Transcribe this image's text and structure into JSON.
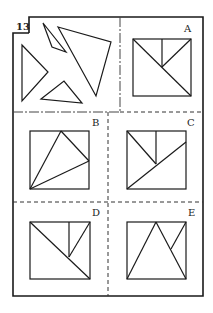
{
  "puzzle": {
    "number": "13",
    "question_panel": {
      "description": "four triangle pieces",
      "pieces": [
        {
          "points": "43,23 52,47 66,52"
        },
        {
          "points": "58,27 111,42 96,96"
        },
        {
          "points": "22,45 48,72 22,101"
        },
        {
          "points": "41,99 64,81 82,103"
        }
      ]
    },
    "options": [
      {
        "label": "A",
        "square": [
          133,
          39,
          58,
          57
        ],
        "lines": [
          "133,39 191,96",
          "162,39 162,67",
          "162,67 191,39"
        ]
      },
      {
        "label": "B",
        "square": [
          30,
          131,
          59,
          58
        ],
        "lines": [
          "30,189 61,131",
          "61,131 89,161",
          "89,161 30,189"
        ]
      },
      {
        "label": "C",
        "square": [
          127,
          131,
          59,
          58
        ],
        "lines": [
          "127,131 156,164",
          "156,131 156,164",
          "127,189 186,142"
        ]
      },
      {
        "label": "D",
        "square": [
          30,
          222,
          60,
          57
        ],
        "lines": [
          "30,222 90,279",
          "69,222 69,257",
          "69,257 90,222"
        ]
      },
      {
        "label": "E",
        "square": [
          127,
          222,
          59,
          57
        ],
        "lines": [
          "127,279 156,222",
          "156,222 186,279",
          "171,249 186,222"
        ]
      }
    ]
  }
}
